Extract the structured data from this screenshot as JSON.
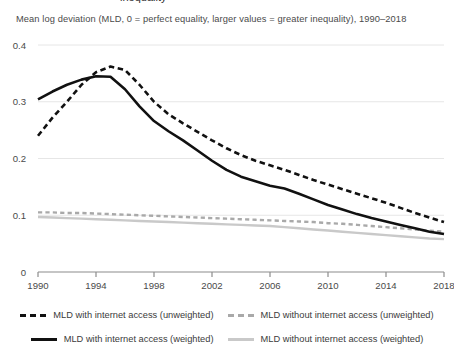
{
  "header": {
    "cropped_title": "inequality",
    "subtitle": "Mean log deviation (MLD, 0 = perfect equality, larger values = greater inequality), 1990–2018"
  },
  "legend": {
    "items": [
      {
        "label": "MLD with internet access (unweighted)",
        "swatch": "dash-dark",
        "color": "#111111",
        "style": "dashed"
      },
      {
        "label": "MLD without internet access (unweighted)",
        "swatch": "dash-gray",
        "color": "#a9a9a9",
        "style": "dashed"
      },
      {
        "label": "MLD with internet access (weighted)",
        "swatch": "solid-dark",
        "color": "#111111",
        "style": "solid"
      },
      {
        "label": "MLD without internet access (weighted)",
        "swatch": "solid-gray",
        "color": "#c9c9c9",
        "style": "solid"
      }
    ]
  },
  "chart_data": {
    "type": "line",
    "title": "",
    "subtitle": "Mean log deviation (MLD, 0 = perfect equality, larger values = greater inequality), 1990–2018",
    "xlabel": "",
    "ylabel": "",
    "xlim": [
      1990,
      2018
    ],
    "ylim": [
      0,
      0.4
    ],
    "yticks": [
      0,
      0.1,
      0.2,
      0.3,
      0.4
    ],
    "ytick_labels": [
      "0",
      "0.1",
      "0.2",
      "0.3",
      "0.4"
    ],
    "xticks": [
      1990,
      1994,
      1998,
      2002,
      2006,
      2010,
      2014,
      2018
    ],
    "xtick_labels": [
      "1990",
      "1994",
      "1998",
      "2002",
      "2006",
      "2010",
      "2014",
      "2018"
    ],
    "grid": "horizontal",
    "legend_position": "bottom",
    "x": [
      1990,
      1991,
      1992,
      1993,
      1994,
      1995,
      1996,
      1997,
      1998,
      1999,
      2000,
      2001,
      2002,
      2003,
      2004,
      2005,
      2006,
      2007,
      2008,
      2009,
      2010,
      2011,
      2012,
      2013,
      2014,
      2015,
      2016,
      2017,
      2018
    ],
    "series": [
      {
        "name": "MLD with internet access (unweighted)",
        "color": "#111111",
        "style": "dashed",
        "values": [
          0.24,
          0.272,
          0.3,
          0.33,
          0.352,
          0.362,
          0.356,
          0.33,
          0.3,
          0.278,
          0.262,
          0.247,
          0.232,
          0.218,
          0.206,
          0.196,
          0.188,
          0.18,
          0.171,
          0.162,
          0.154,
          0.146,
          0.138,
          0.13,
          0.122,
          0.113,
          0.104,
          0.096,
          0.088
        ]
      },
      {
        "name": "MLD without internet access (unweighted)",
        "color": "#a9a9a9",
        "style": "dashed",
        "values": [
          0.105,
          0.105,
          0.104,
          0.104,
          0.103,
          0.102,
          0.101,
          0.1,
          0.099,
          0.098,
          0.097,
          0.096,
          0.095,
          0.094,
          0.093,
          0.092,
          0.091,
          0.09,
          0.089,
          0.088,
          0.086,
          0.085,
          0.083,
          0.081,
          0.079,
          0.077,
          0.075,
          0.073,
          0.071
        ]
      },
      {
        "name": "MLD with internet access (weighted)",
        "color": "#111111",
        "style": "solid",
        "values": [
          0.304,
          0.318,
          0.33,
          0.339,
          0.345,
          0.344,
          0.322,
          0.292,
          0.266,
          0.248,
          0.232,
          0.214,
          0.196,
          0.18,
          0.168,
          0.16,
          0.152,
          0.147,
          0.138,
          0.128,
          0.118,
          0.11,
          0.102,
          0.095,
          0.089,
          0.083,
          0.077,
          0.071,
          0.067
        ]
      },
      {
        "name": "MLD without internet access (weighted)",
        "color": "#c9c9c9",
        "style": "solid",
        "values": [
          0.097,
          0.096,
          0.095,
          0.094,
          0.093,
          0.092,
          0.091,
          0.09,
          0.089,
          0.088,
          0.087,
          0.086,
          0.085,
          0.084,
          0.083,
          0.082,
          0.081,
          0.079,
          0.077,
          0.075,
          0.073,
          0.071,
          0.069,
          0.067,
          0.065,
          0.063,
          0.061,
          0.059,
          0.058
        ]
      }
    ]
  }
}
